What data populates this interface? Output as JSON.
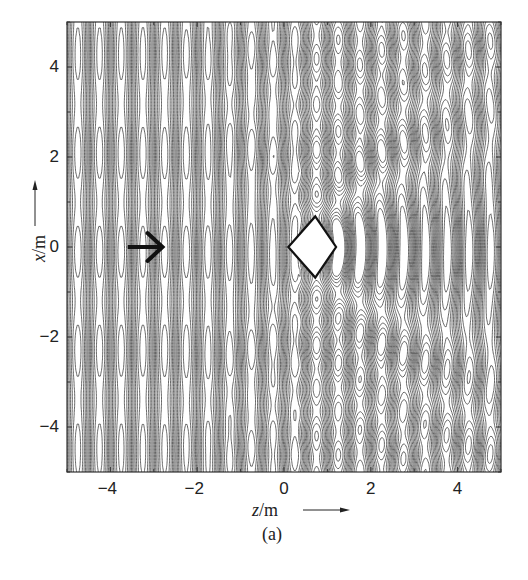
{
  "chart_data": {
    "type": "contour",
    "title": "",
    "subtitle": "",
    "caption": "(a)",
    "xlabel": "z/m",
    "ylabel": "x/m",
    "xlabel_var": "z",
    "xlabel_unit": "/m",
    "ylabel_var": "x",
    "ylabel_unit": "/m",
    "xlim": [
      -5,
      5
    ],
    "ylim": [
      -5,
      5
    ],
    "xticks": [
      -4,
      -2,
      0,
      2,
      4
    ],
    "yticks": [
      -4,
      -2,
      0,
      2,
      4
    ],
    "xtick_labels": [
      "−4",
      "−2",
      "0",
      "2",
      "4"
    ],
    "ytick_labels": [
      "4",
      "2",
      "0",
      "−2",
      "−4"
    ],
    "minor_ticks": true,
    "grid": false,
    "legend": null,
    "field_description": "Contour lines of a wave field: plane wave incident from left (direction +z) scattered by a diamond-shaped obstacle",
    "incident_wave_arrow": {
      "from": [
        -3.6,
        0
      ],
      "to": [
        -2.8,
        0
      ],
      "direction": "+z"
    },
    "obstacle": {
      "shape": "diamond",
      "vertices": [
        [
          0.72,
          0.68
        ],
        [
          1.2,
          0
        ],
        [
          0.72,
          -0.68
        ],
        [
          0.1,
          0
        ]
      ]
    },
    "wavelength_m": 1.0,
    "contour_levels": 14,
    "colors": {
      "line": "#555555",
      "axes": "#333333",
      "arrow": "#111111",
      "background": "#ffffff"
    }
  }
}
